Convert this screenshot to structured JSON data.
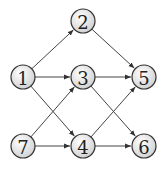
{
  "diagram": {
    "type": "directed-graph",
    "nodes": [
      {
        "id": "1",
        "label": "1",
        "x": 23,
        "y": 77
      },
      {
        "id": "2",
        "label": "2",
        "x": 83,
        "y": 21
      },
      {
        "id": "3",
        "label": "3",
        "x": 83,
        "y": 77
      },
      {
        "id": "4",
        "label": "4",
        "x": 83,
        "y": 146
      },
      {
        "id": "5",
        "label": "5",
        "x": 144,
        "y": 77
      },
      {
        "id": "6",
        "label": "6",
        "x": 144,
        "y": 146
      },
      {
        "id": "7",
        "label": "7",
        "x": 23,
        "y": 146
      }
    ],
    "edges": [
      {
        "from": "1",
        "to": "2"
      },
      {
        "from": "1",
        "to": "3"
      },
      {
        "from": "1",
        "to": "4"
      },
      {
        "from": "2",
        "to": "5"
      },
      {
        "from": "3",
        "to": "5"
      },
      {
        "from": "3",
        "to": "6"
      },
      {
        "from": "7",
        "to": "3"
      },
      {
        "from": "7",
        "to": "4"
      },
      {
        "from": "4",
        "to": "5"
      },
      {
        "from": "4",
        "to": "6"
      }
    ],
    "node_radius": 12,
    "colors": {
      "node_fill_light": "#ffffff",
      "node_fill_dark": "#d0d0d0",
      "stroke": "#333333",
      "edge": "#444444"
    }
  }
}
